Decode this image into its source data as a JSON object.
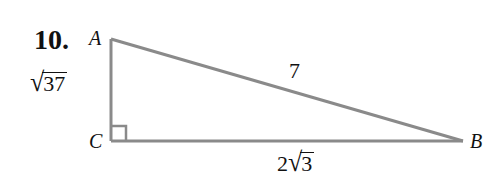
{
  "problem": {
    "number": "10."
  },
  "triangle": {
    "vertices": {
      "A": {
        "label": "A",
        "x": 111,
        "y": 39
      },
      "B": {
        "label": "B",
        "x": 463,
        "y": 141
      },
      "C": {
        "label": "C",
        "x": 111,
        "y": 141
      }
    },
    "right_angle_at": "C",
    "stroke_color": "#8a8a8a",
    "sides": {
      "AC": {
        "label_coef": "",
        "label_radicand": "37"
      },
      "AB": {
        "label": "7"
      },
      "CB": {
        "label_coef": "2",
        "label_radicand": "3"
      }
    }
  },
  "symbols": {
    "radical": "√"
  }
}
